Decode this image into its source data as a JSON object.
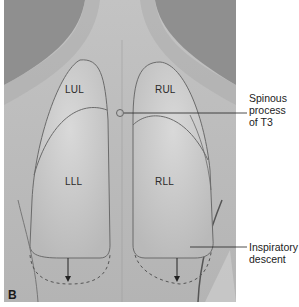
{
  "figure": {
    "panel_letter": "B",
    "lobes": {
      "lul": "LUL",
      "rul": "RUL",
      "lll": "LLL",
      "rll": "RLL"
    },
    "callouts": [
      {
        "id": "spinous",
        "lines": [
          "Spinous",
          "process",
          "of T3"
        ]
      },
      {
        "id": "descent",
        "lines": [
          "Inspiratory",
          "descent"
        ]
      }
    ],
    "colors": {
      "background": "#ffffff",
      "back_skin": "#b9b9b9",
      "shadow": "#8f8f8f",
      "lung_fill": "#c9c9c9",
      "lung_outline": "#6b6b6b",
      "label_text": "#222222"
    }
  }
}
